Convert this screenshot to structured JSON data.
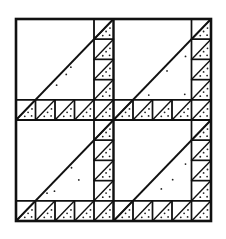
{
  "figure": {
    "type": "quilt-block-diagram",
    "grid": {
      "rows": 2,
      "cols": 2
    },
    "small_cells_per_edge": 5,
    "colors": {
      "line": "#111111",
      "background": "#ffffff",
      "dot": "#222222"
    }
  }
}
